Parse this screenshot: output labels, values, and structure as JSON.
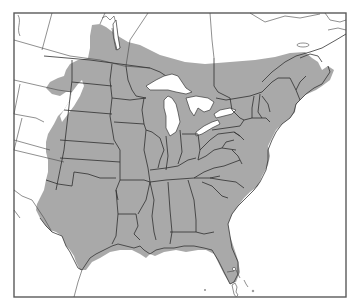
{
  "map": {
    "type": "species-range-map",
    "region": "Eastern and Central North America",
    "colors": {
      "range_fill": "#a9a9a9",
      "land_fill": "#ffffff",
      "water_fill": "#ffffff",
      "border_stroke": "#2e2e2e",
      "frame_stroke": "#5a5a5a"
    },
    "layers": [
      {
        "name": "shaded-range",
        "description": "Gray-shaded distribution range covering eastern US and southern Canada"
      },
      {
        "name": "great-lakes",
        "items": [
          "Lake Superior",
          "Lake Michigan",
          "Lake Huron",
          "Lake Erie",
          "Lake Ontario"
        ]
      },
      {
        "name": "state-province-borders"
      },
      {
        "name": "coastlines"
      },
      {
        "name": "caribbean-islands"
      }
    ]
  }
}
